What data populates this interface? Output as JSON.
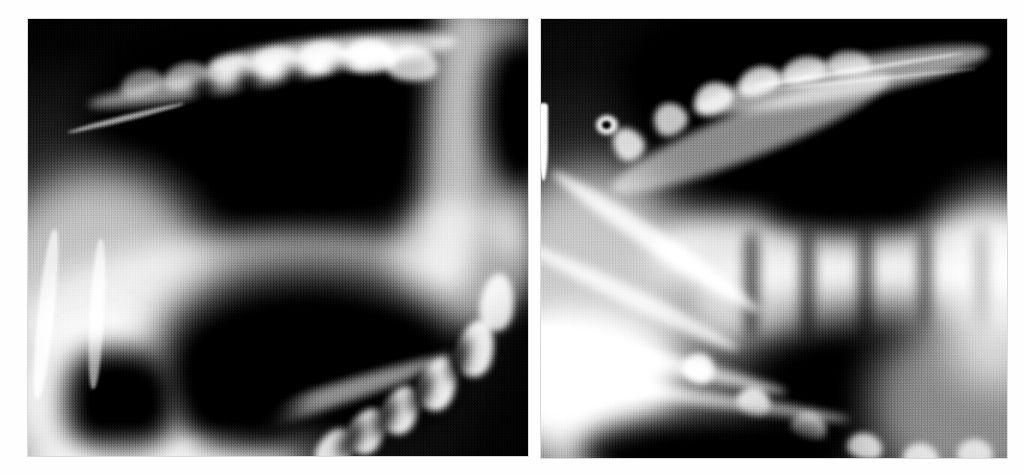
{
  "figure": {
    "kind": "radiograph-pair",
    "background_color": "#ffffff",
    "caption": "",
    "panel_count": 2
  },
  "panels": [
    {
      "id": "panel-left",
      "name": "left-radiograph",
      "label": "",
      "modality": "X-ray",
      "view": "lateral jaw / dental arcade",
      "x": 28,
      "y": 19,
      "width": 500,
      "height": 437,
      "film_background": "#060606",
      "bone_highlight": "#e8e8e8",
      "soft_tissue": "#8a8a8a",
      "air_space": "#040404",
      "features": [
        "upper dental arcade with scalloped cusps along the superior border",
        "large radiolucent oral cavity / airway (black)",
        "oblique radiopaque band crossing the mid-field",
        "lower dental arcade with five bright rounded cusps at lower right",
        "vertical radiopaque ramus column at the right edge"
      ]
    },
    {
      "id": "panel-right",
      "name": "right-radiograph",
      "label": "",
      "modality": "X-ray",
      "view": "lateral jaw / cervical spine",
      "x": 541,
      "y": 19,
      "width": 466,
      "height": 439,
      "film_background": "#060606",
      "bone_highlight": "#efefef",
      "soft_tissue": "#909090",
      "air_space": "#040404",
      "features": [
        "thin bright vertical artifact streak at the left margin",
        "arched radiopaque dental arcade sweeping up to the right",
        "bright horizontal vertebral body band across the mid-field",
        "segmented vertebral column with intervertebral spaces",
        "lower mandibular arcade with repeating bright cusps at bottom"
      ]
    }
  ],
  "colors": {
    "page_background": "#ffffff",
    "film_black": "#050505",
    "bone_white": "#f2f2f2",
    "mid_gray": "#8f8f8f",
    "panel_border": "#bebebe"
  }
}
